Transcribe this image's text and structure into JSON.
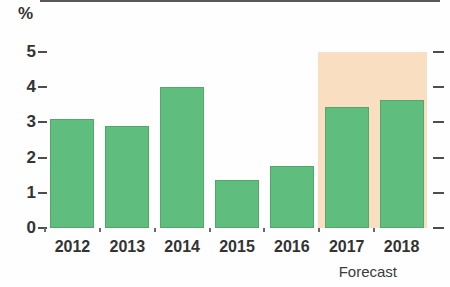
{
  "chart_data": {
    "type": "bar",
    "title": "",
    "subtitle": "",
    "xlabel": "",
    "ylabel": "%",
    "unit_label": "%",
    "categories": [
      "2012",
      "2013",
      "2014",
      "2015",
      "2016",
      "2017",
      "2018"
    ],
    "values": [
      3.1,
      2.9,
      4.0,
      1.35,
      1.75,
      3.45,
      3.65
    ],
    "series": [
      {
        "name": "Growth",
        "values": [
          3.1,
          2.9,
          4.0,
          1.35,
          1.75,
          3.45,
          3.65
        ]
      }
    ],
    "ylim": [
      0,
      5
    ],
    "yticks": [
      0,
      1,
      2,
      3,
      4,
      5
    ],
    "ytick_labels": [
      "0",
      "1",
      "2",
      "3",
      "4",
      "5"
    ],
    "grid": false,
    "legend": false,
    "legend_position": "none",
    "annotations": [
      {
        "text": "Forecast",
        "categories": [
          "2017",
          "2018"
        ],
        "kind": "shaded-region-caption"
      }
    ],
    "forecast_region": {
      "label": "Forecast",
      "from_category": "2017",
      "to_category": "2018",
      "top_value": 5.0,
      "color": "#fadec2"
    },
    "colors": {
      "bar_fill": "#5fbe7d",
      "bar_stroke": "#51a86d",
      "forecast_band": "#fadec2",
      "axis": "#585858",
      "text": "#333333"
    }
  },
  "axes": {
    "y_unit": "%",
    "y_tick_labels": [
      "5",
      "4",
      "3",
      "2",
      "1",
      "0"
    ]
  },
  "footer": {
    "forecast_label": "Forecast"
  }
}
